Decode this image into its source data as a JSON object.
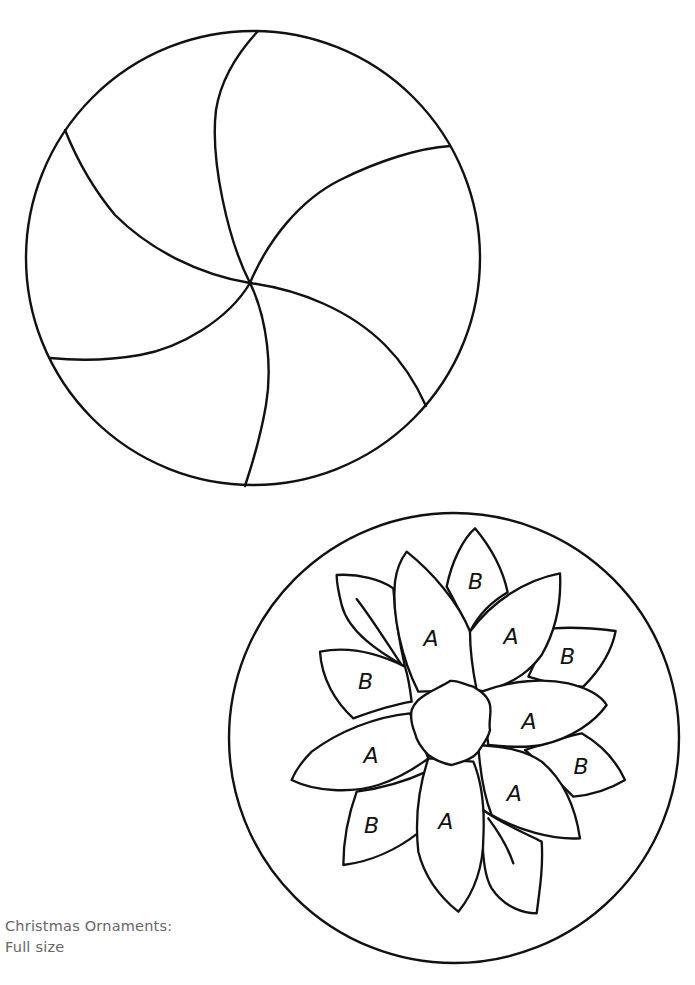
{
  "caption": {
    "line1": "Christmas Ornaments:",
    "line2": "Full size"
  },
  "ornaments": [
    {
      "name": "pinwheel-ornament",
      "shape": "circle",
      "segments": 6
    },
    {
      "name": "flower-ornament",
      "shape": "circle",
      "petal_labels": {
        "top_b": "B",
        "upper_a": "A",
        "upper_right_a": "A",
        "upper_right_b": "B",
        "left_b": "B",
        "right_a": "A",
        "left_a": "A",
        "right_b": "B",
        "lower_right_a": "A",
        "lower_left_b": "B",
        "bottom_a": "A"
      }
    }
  ],
  "colors": {
    "line": "#111111",
    "caption": "#666666",
    "background": "#ffffff"
  }
}
